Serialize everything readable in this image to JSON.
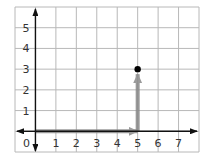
{
  "chart_data": {
    "type": "scatter",
    "title": "",
    "xlabel": "",
    "ylabel": "",
    "xlim": [
      -1,
      8
    ],
    "ylim": [
      -1,
      6
    ],
    "grid": true,
    "x_ticks": [
      "0",
      "1",
      "2",
      "3",
      "4",
      "5",
      "6",
      "7"
    ],
    "y_ticks": [
      "1",
      "2",
      "3",
      "4",
      "5"
    ],
    "points": [
      {
        "x": 5,
        "y": 3,
        "label": ""
      }
    ],
    "vectors": [
      {
        "from": [
          0,
          0
        ],
        "to": [
          5,
          0
        ],
        "color": "#888888",
        "description": "horizontal movement right 5"
      },
      {
        "from": [
          5,
          0
        ],
        "to": [
          5,
          3
        ],
        "color": "#888888",
        "description": "vertical movement up 3"
      }
    ]
  },
  "labels": {
    "origin": "0",
    "x": [
      "1",
      "2",
      "3",
      "4",
      "5",
      "6",
      "7"
    ],
    "y": [
      "1",
      "2",
      "3",
      "4",
      "5"
    ]
  },
  "colors": {
    "grid": "#b8b8b8",
    "axis": "#111111",
    "vector": "#8a8a8a",
    "point": "#000000",
    "text": "#333333"
  }
}
